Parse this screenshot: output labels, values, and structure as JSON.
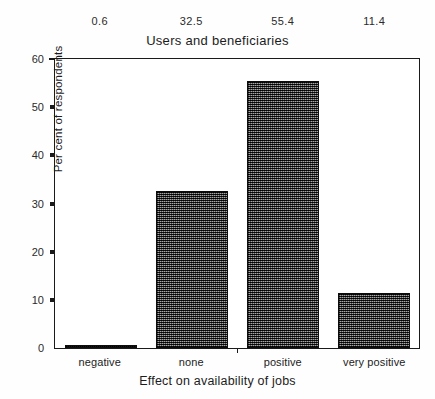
{
  "chart_data": {
    "type": "bar",
    "title": "Users and beneficiaries",
    "xlabel": "Effect on availability of jobs",
    "ylabel": "Per cent of respondents",
    "categories": [
      "negative",
      "none",
      "positive",
      "very positive"
    ],
    "values": [
      0.6,
      32.5,
      55.4,
      11.4
    ],
    "value_labels": [
      "0.6",
      "32.5",
      "55.4",
      "11.4"
    ],
    "ylim": [
      0,
      60
    ],
    "yticks": [
      0,
      10,
      20,
      30,
      40,
      50,
      60
    ],
    "ytick_labels": [
      "0",
      "10",
      "20",
      "30",
      "40",
      "50",
      "60"
    ],
    "grid": false,
    "legend": "none",
    "bar_fill": "#4a4a4a",
    "bar_edge": "#0d0d0d",
    "axis_color": "#1a1a1a",
    "background": "#ffffff"
  }
}
